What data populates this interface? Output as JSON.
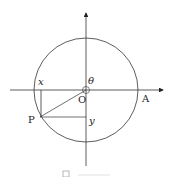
{
  "diagram": {
    "type": "unit-circle",
    "labels": {
      "origin": "O",
      "point_a": "A",
      "point_p": "P",
      "x": "x",
      "y": "y",
      "angle": "θ"
    },
    "caption": "図"
  }
}
